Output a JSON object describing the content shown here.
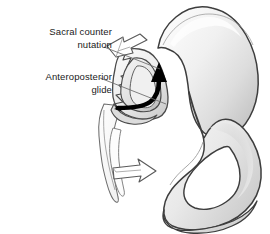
{
  "figure": {
    "type": "anatomical-illustration",
    "view": "lateral-oblique",
    "background_color": "#ffffff",
    "width": 270,
    "height": 234
  },
  "labels": {
    "sacral_counter_nutation": {
      "line1": "Sacral counter",
      "line2": "nutation"
    },
    "anteroposterior_glide": {
      "line1": "Anteroposterior",
      "line2": "glide"
    }
  },
  "colors": {
    "outline": "#3d3d3d",
    "bone_light": "#f4f4f4",
    "bone_mid": "#e2e2e2",
    "bone_shadow": "#bcbcbc",
    "bone_deep_shadow": "#9a9a9a",
    "arrow_black": "#000000",
    "arrow_white_fill": "#ffffff",
    "arrow_white_stroke": "#555555",
    "leader_line": "#6a6a6a",
    "text": "#1a1a1a",
    "foramen": "#ffffff"
  },
  "annotations": {
    "white_arrow_superior": {
      "name": "sacral-counter-nutation-arrow",
      "direction": "up-right",
      "style": "open-block-arrow"
    },
    "white_arrow_inferior": {
      "name": "coccyx-glide-arrow",
      "direction": "right",
      "style": "open-block-arrow"
    },
    "black_arrow_curved": {
      "name": "anteroposterior-glide-arrow",
      "direction": "right-then-up",
      "style": "solid-curved-arrow"
    }
  },
  "structures": {
    "ilium": "iliac wing",
    "auricular_surface": "sacroiliac articular surface",
    "obturator_foramen": "obturator foramen",
    "ischium": "ischial ramus",
    "sacrum": "sacrum and coccyx outline"
  }
}
